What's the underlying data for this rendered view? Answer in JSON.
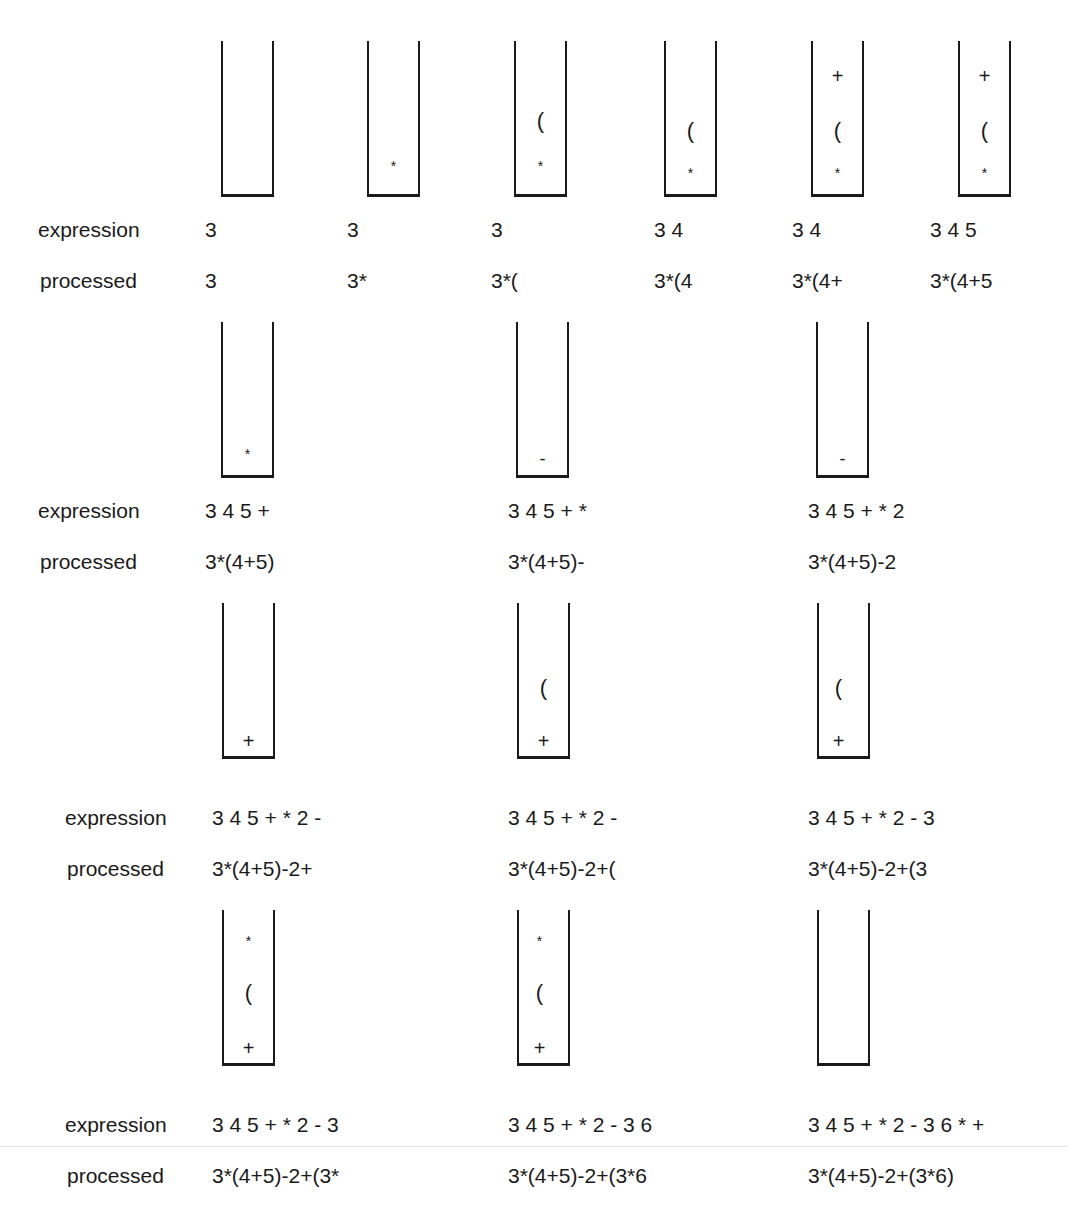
{
  "labels": {
    "expression": "expression",
    "processed": "processed"
  },
  "symbols": {
    "star": "*",
    "paren": "(",
    "plus": "+",
    "minus": "-"
  },
  "rows": [
    {
      "steps": [
        {
          "stack": [],
          "expression": "3",
          "processed": "3"
        },
        {
          "stack": [
            "*"
          ],
          "expression": "3",
          "processed": "3*"
        },
        {
          "stack": [
            "*",
            "("
          ],
          "expression": "3",
          "processed": "3*("
        },
        {
          "stack": [
            "*",
            "("
          ],
          "expression": "3 4",
          "processed": "3*(4"
        },
        {
          "stack": [
            "*",
            "(",
            "+"
          ],
          "expression": "3 4",
          "processed": "3*(4+"
        },
        {
          "stack": [
            "*",
            "(",
            "+"
          ],
          "expression": "3 4 5",
          "processed": "3*(4+5"
        }
      ]
    },
    {
      "steps": [
        {
          "stack": [
            "*"
          ],
          "expression": "3 4 5 +",
          "processed": "3*(4+5)"
        },
        {
          "stack": [
            "-"
          ],
          "expression": "3 4 5 + *",
          "processed": "3*(4+5)-"
        },
        {
          "stack": [
            "-"
          ],
          "expression": "3 4 5 + * 2",
          "processed": "3*(4+5)-2"
        }
      ]
    },
    {
      "steps": [
        {
          "stack": [
            "+"
          ],
          "expression": "3 4 5 + * 2 -",
          "processed": "3*(4+5)-2+"
        },
        {
          "stack": [
            "+",
            "("
          ],
          "expression": "3 4 5 + * 2 -",
          "processed": "3*(4+5)-2+("
        },
        {
          "stack": [
            "+",
            "("
          ],
          "expression": "3 4 5 + * 2 - 3",
          "processed": "3*(4+5)-2+(3"
        }
      ]
    },
    {
      "steps": [
        {
          "stack": [
            "+",
            "(",
            "*"
          ],
          "expression": "3 4 5 + * 2 - 3",
          "processed": "3*(4+5)-2+(3*"
        },
        {
          "stack": [
            "+",
            "(",
            "*"
          ],
          "expression": "3 4 5 + * 2 - 3 6",
          "processed": "3*(4+5)-2+(3*6"
        },
        {
          "stack": [],
          "expression": "3 4 5 + * 2 - 3 6 * +",
          "processed": "3*(4+5)-2+(3*6)"
        }
      ]
    }
  ]
}
